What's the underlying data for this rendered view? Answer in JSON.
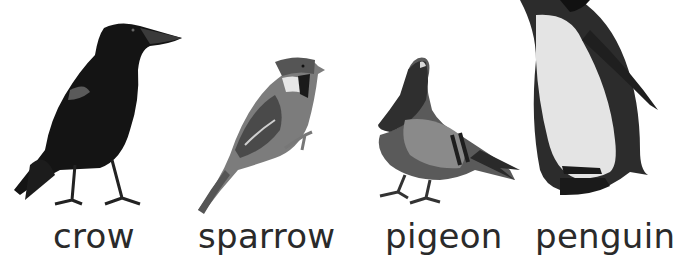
{
  "birds": [
    {
      "name": "crow",
      "label": "crow"
    },
    {
      "name": "sparrow",
      "label": "sparrow"
    },
    {
      "name": "pigeon",
      "label": "pigeon"
    },
    {
      "name": "penguin",
      "label": "penguin"
    }
  ],
  "colors": {
    "background": "#ffffff",
    "label_text": "#2a2a2a"
  }
}
